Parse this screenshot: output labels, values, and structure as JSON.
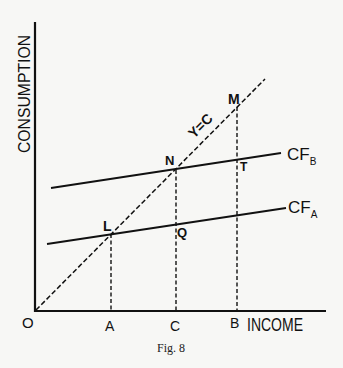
{
  "figure": {
    "caption": "Fig. 8",
    "axes": {
      "y_label": "CONSUMPTION",
      "x_label": "INCOME",
      "origin_label": "O"
    },
    "lines": {
      "forty_five_line_label": "Y=C",
      "cf_a": {
        "base": "CF",
        "sub": "A"
      },
      "cf_b": {
        "base": "CF",
        "sub": "B"
      }
    },
    "points": {
      "L": "L",
      "N": "N",
      "M": "M",
      "Q": "Q",
      "T": "T"
    },
    "x_ticks": {
      "A": "A",
      "C": "C",
      "B": "B"
    },
    "colors": {
      "ink": "#111111",
      "paper": "#f7f7f5"
    }
  }
}
